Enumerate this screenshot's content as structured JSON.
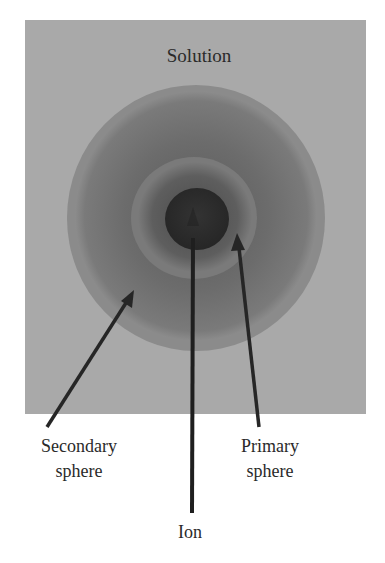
{
  "diagram": {
    "solution_label": "Solution",
    "labels": {
      "secondary_line1": "Secondary",
      "secondary_line2": "sphere",
      "primary_line1": "Primary",
      "primary_line2": "sphere",
      "ion": "Ion"
    },
    "colors": {
      "solution_bg": "#a9a9a9",
      "secondary_rim": "#8b8b8b",
      "secondary_inner": "#6f6f6f",
      "primary_rim": "#7a7a7a",
      "primary_inner": "#5c5c5c",
      "ion": "#2f2f2f",
      "arrow": "#262626"
    }
  }
}
